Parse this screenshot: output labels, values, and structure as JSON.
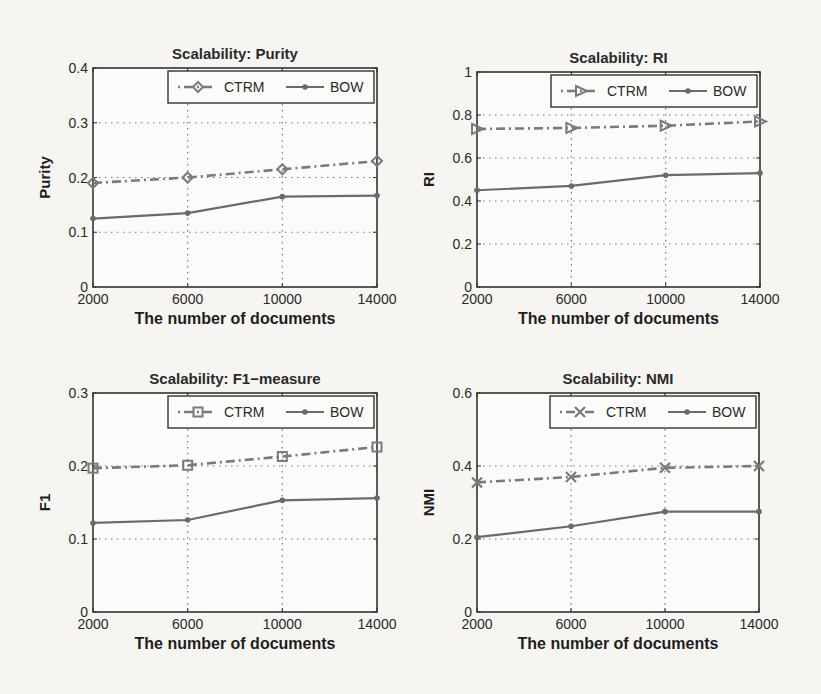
{
  "figure": {
    "panels": [
      {
        "id": "purity",
        "title": "Scalability: Purity",
        "ylabel": "Purity",
        "xlabel": "The number of documents"
      },
      {
        "id": "ri",
        "title": "Scalability: RI",
        "ylabel": "RI",
        "xlabel": "The number of documents"
      },
      {
        "id": "f1",
        "title": "Scalability: F1−measure",
        "ylabel": "F1",
        "xlabel": "The number of documents"
      },
      {
        "id": "nmi",
        "title": "Scalability: NMI",
        "ylabel": "NMI",
        "xlabel": "The number of documents"
      }
    ],
    "colors": {
      "ctrm": "#7a7a7a",
      "bow": "#6a6a6a",
      "axis": "#333333",
      "grid": "#777777"
    }
  },
  "chart_data": [
    {
      "type": "line",
      "title": "Scalability: Purity",
      "xlabel": "The number of documents",
      "ylabel": "Purity",
      "x": [
        2000,
        6000,
        10000,
        14000
      ],
      "xticks": [
        "2000",
        "6000",
        "10000",
        "14000"
      ],
      "ylim": [
        0,
        0.4
      ],
      "yticks": [
        "0",
        "0.1",
        "0.2",
        "0.3",
        "0.4"
      ],
      "grid": true,
      "legend_position": "top-right",
      "series": [
        {
          "name": "CTRM",
          "marker": "diamond",
          "linestyle": "dash-dot",
          "values": [
            0.19,
            0.2,
            0.215,
            0.23
          ]
        },
        {
          "name": "BOW",
          "marker": "dot",
          "linestyle": "solid",
          "values": [
            0.125,
            0.135,
            0.165,
            0.167
          ]
        }
      ]
    },
    {
      "type": "line",
      "title": "Scalability: RI",
      "xlabel": "The number of documents",
      "ylabel": "RI",
      "x": [
        2000,
        6000,
        10000,
        14000
      ],
      "xticks": [
        "2000",
        "6000",
        "10000",
        "14000"
      ],
      "ylim": [
        0,
        1
      ],
      "yticks": [
        "0",
        "0.2",
        "0.4",
        "0.6",
        "0.8",
        "1"
      ],
      "grid": true,
      "legend_position": "top-right",
      "series": [
        {
          "name": "CTRM",
          "marker": "triangle-right",
          "linestyle": "dash-dot",
          "values": [
            0.735,
            0.74,
            0.75,
            0.77
          ]
        },
        {
          "name": "BOW",
          "marker": "dot",
          "linestyle": "solid",
          "values": [
            0.45,
            0.47,
            0.52,
            0.53
          ]
        }
      ]
    },
    {
      "type": "line",
      "title": "Scalability: F1−measure",
      "xlabel": "The number of documents",
      "ylabel": "F1",
      "x": [
        2000,
        6000,
        10000,
        14000
      ],
      "xticks": [
        "2000",
        "6000",
        "10000",
        "14000"
      ],
      "ylim": [
        0,
        0.3
      ],
      "yticks": [
        "0",
        "0.1",
        "0.2",
        "0.3"
      ],
      "grid": true,
      "legend_position": "top-right",
      "series": [
        {
          "name": "CTRM",
          "marker": "square",
          "linestyle": "dash-dot",
          "values": [
            0.197,
            0.201,
            0.213,
            0.226
          ]
        },
        {
          "name": "BOW",
          "marker": "dot",
          "linestyle": "solid",
          "values": [
            0.122,
            0.126,
            0.153,
            0.156
          ]
        }
      ]
    },
    {
      "type": "line",
      "title": "Scalability: NMI",
      "xlabel": "The number of documents",
      "ylabel": "NMI",
      "x": [
        2000,
        6000,
        10000,
        14000
      ],
      "xticks": [
        "2000",
        "6000",
        "10000",
        "14000"
      ],
      "ylim": [
        0,
        0.6
      ],
      "yticks": [
        "0",
        "0.2",
        "0.4",
        "0.6"
      ],
      "grid": true,
      "legend_position": "top-right",
      "series": [
        {
          "name": "CTRM",
          "marker": "x",
          "linestyle": "dash-dot",
          "values": [
            0.355,
            0.37,
            0.395,
            0.4
          ]
        },
        {
          "name": "BOW",
          "marker": "dot",
          "linestyle": "solid",
          "values": [
            0.205,
            0.235,
            0.275,
            0.275
          ]
        }
      ]
    }
  ]
}
